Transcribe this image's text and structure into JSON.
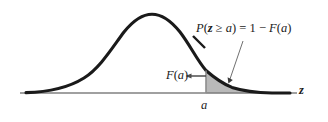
{
  "figure": {
    "background_color": "#ffffff"
  },
  "labels": {
    "probability": {
      "text": "P(z ≥ a) = 1 − F(a)",
      "parts": {
        "p": "P",
        "open": "(",
        "z": "z",
        "ge": " ≥ ",
        "a": "a",
        "close": ")",
        "equals": " = ",
        "one": "1",
        "minus": " − ",
        "f": "F",
        "open2": "(",
        "a2": "a",
        "close2": ")"
      }
    },
    "cdf": {
      "text": "F(a)",
      "parts": {
        "f": "F",
        "open": "(",
        "a": "a",
        "close": ")"
      }
    },
    "axis_point": {
      "text": "a"
    },
    "axis_name": {
      "text": "z"
    }
  },
  "colors": {
    "curve": "#1a1a1a",
    "axis": "#808080",
    "shaded_area": "#b9b9b9",
    "shaded_border": "#9a9a9a",
    "arrow": "#4d4d4d",
    "leader_line": "#707070",
    "text": "#1a1a1a"
  },
  "geometry": {
    "axis_y": 93,
    "axis_x_start": 20,
    "axis_x_end": 297,
    "peak_x": 152,
    "peak_y": 14,
    "cutoff_x": 206,
    "curve_tail_left_x": 26,
    "curve_tail_right_x": 290
  }
}
